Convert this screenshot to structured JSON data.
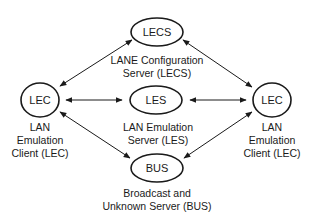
{
  "diagram": {
    "nodes": [
      {
        "id": "lecs",
        "label": "LECS",
        "caption": [
          "LANE Configuration",
          "Server (LECS)"
        ]
      },
      {
        "id": "les",
        "label": "LES",
        "caption": [
          "LAN Emulation",
          "Server (LES)"
        ]
      },
      {
        "id": "bus",
        "label": "BUS",
        "caption": [
          "Broadcast and",
          "Unknown Server (BUS)"
        ]
      },
      {
        "id": "lec_left",
        "label": "LEC",
        "caption": [
          "LAN",
          "Emulation",
          "Client (LEC)"
        ]
      },
      {
        "id": "lec_right",
        "label": "LEC",
        "caption": [
          "LAN",
          "Emulation",
          "Client (LEC)"
        ]
      }
    ],
    "edges": [
      {
        "from": "lec_left",
        "to": "lecs",
        "direction": "bidirectional"
      },
      {
        "from": "lec_left",
        "to": "les",
        "direction": "bidirectional"
      },
      {
        "from": "lec_left",
        "to": "bus",
        "direction": "bidirectional"
      },
      {
        "from": "lec_right",
        "to": "lecs",
        "direction": "bidirectional"
      },
      {
        "from": "lec_right",
        "to": "les",
        "direction": "bidirectional"
      },
      {
        "from": "lec_right",
        "to": "bus",
        "direction": "bidirectional"
      }
    ],
    "colors": {
      "stroke": "#1a1a1a",
      "background": "#ffffff"
    }
  }
}
